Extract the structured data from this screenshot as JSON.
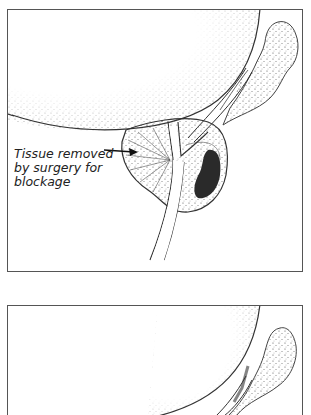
{
  "figure": {
    "panels": [
      {
        "id": "before",
        "annotation": {
          "lines": [
            "Tissue removed",
            "by surgery for",
            "blockage"
          ]
        }
      },
      {
        "id": "after"
      }
    ]
  }
}
